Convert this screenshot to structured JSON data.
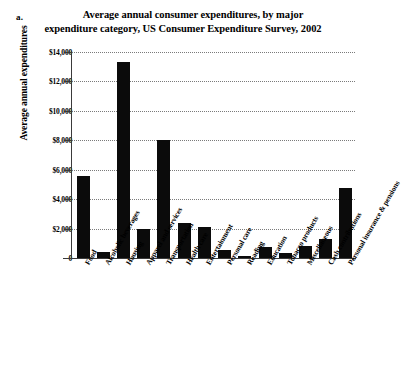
{
  "figure": {
    "label": "a."
  },
  "title": {
    "line1": "Average annual consumer expenditures, by major",
    "line2": "expenditure category, US Consumer Expenditure Survey, 2002"
  },
  "axis": {
    "y_title": "Average annual expenditures",
    "y_ticks": [
      "$14,000",
      "$12,000",
      "$10,000",
      "$8,000",
      "$6,000",
      "$4,000",
      "$2,000",
      "0"
    ]
  },
  "chart_data": {
    "type": "bar",
    "title": "Average annual consumer expenditures, by major expenditure category, US Consumer Expenditure Survey, 2002",
    "xlabel": "",
    "ylabel": "Average annual expenditures",
    "ylim": [
      0,
      14000
    ],
    "ytick_values": [
      0,
      2000,
      4000,
      6000,
      8000,
      10000,
      12000,
      14000
    ],
    "grid": true,
    "legend": "none",
    "bar_color": "#0b0b0b",
    "categories": [
      "Food",
      "Alcoholic beverages",
      "Housing",
      "Apparel and services",
      "Transportation",
      "Health care",
      "Entertainment",
      "Personal care",
      "Reading",
      "Education",
      "Tobacco products",
      "Miscellaneous",
      "Cash contributions",
      "Personal insurance & pensions"
    ],
    "values": [
      5600,
      400,
      13300,
      1950,
      8000,
      2350,
      2080,
      525,
      140,
      750,
      320,
      800,
      1300,
      4750
    ]
  }
}
